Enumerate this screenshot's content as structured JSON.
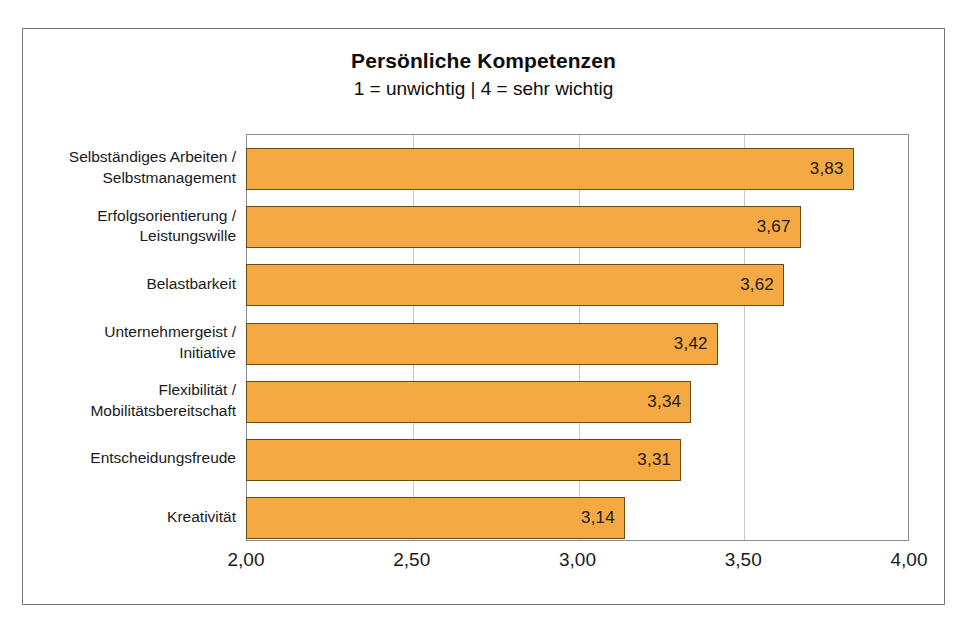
{
  "chart_data": {
    "type": "bar",
    "orientation": "horizontal",
    "title": "Persönliche Kompetenzen",
    "subtitle": "1 = unwichtig | 4 = sehr wichtig",
    "xlabel": "",
    "ylabel": "",
    "xlim": [
      2.0,
      4.0
    ],
    "xticks": [
      "2,00",
      "2,50",
      "3,00",
      "3,50",
      "4,00"
    ],
    "xtick_values": [
      2.0,
      2.5,
      3.0,
      3.5,
      4.0
    ],
    "grid": true,
    "grid_axis": "x",
    "legend": false,
    "categories": [
      "Selbständiges Arbeiten / Selbstmanagement",
      "Erfolgsorientierung / Leistungswille",
      "Belastbarkeit",
      "Unternehmergeist / Initiative",
      "Flexibilität / Mobilitätsbereitschaft",
      "Entscheidungsfreude",
      "Kreativität"
    ],
    "values": [
      3.83,
      3.67,
      3.62,
      3.42,
      3.34,
      3.31,
      3.14
    ],
    "value_labels": [
      "3,83",
      "3,67",
      "3,62",
      "3,42",
      "3,34",
      "3,31",
      "3,14"
    ],
    "bars": [
      {
        "category_line1": "Selbständiges Arbeiten /",
        "category_line2": "Selbstmanagement",
        "value": 3.83,
        "label": "3,83"
      },
      {
        "category_line1": "Erfolgsorientierung /",
        "category_line2": "Leistungswille",
        "value": 3.67,
        "label": "3,67"
      },
      {
        "category_line1": "Belastbarkeit",
        "category_line2": "",
        "value": 3.62,
        "label": "3,62"
      },
      {
        "category_line1": "Unternehmergeist /",
        "category_line2": "Initiative",
        "value": 3.42,
        "label": "3,42"
      },
      {
        "category_line1": "Flexibilität /",
        "category_line2": "Mobilitätsbereitschaft",
        "value": 3.34,
        "label": "3,34"
      },
      {
        "category_line1": "Entscheidungsfreude",
        "category_line2": "",
        "value": 3.31,
        "label": "3,31"
      },
      {
        "category_line1": "Kreativität",
        "category_line2": "",
        "value": 3.14,
        "label": "3,14"
      }
    ],
    "colors": {
      "bar_fill": "#F5A942",
      "bar_border": "#6B4A13",
      "gridline": "#C8C8C8",
      "plot_border": "#8D8D8D",
      "frame_border": "#7A7A7A",
      "text": "#1A1A1A",
      "background": "#FFFFFF"
    }
  }
}
